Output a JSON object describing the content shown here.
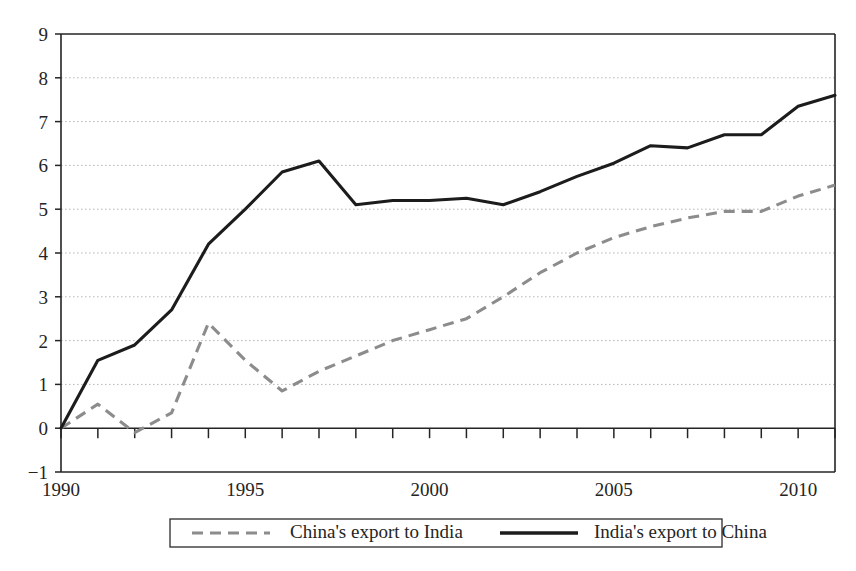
{
  "chart_data": {
    "type": "line",
    "title": "",
    "subtitle": "",
    "xlabel": "",
    "ylabel": "",
    "xlim": [
      1990,
      2011
    ],
    "ylim": [
      -1,
      9
    ],
    "grid": true,
    "legend_position": "bottom",
    "y_ticks": [
      -1,
      0,
      1,
      2,
      3,
      4,
      5,
      6,
      7,
      8,
      9
    ],
    "y_tick_labels": [
      "−1",
      "0",
      "1",
      "2",
      "3",
      "4",
      "5",
      "6",
      "7",
      "8",
      "9"
    ],
    "x_ticks": [
      1990,
      1991,
      1992,
      1993,
      1994,
      1995,
      1996,
      1997,
      1998,
      1999,
      2000,
      2001,
      2002,
      2003,
      2004,
      2005,
      2006,
      2007,
      2008,
      2009,
      2010,
      2011
    ],
    "x_tick_labels": [
      "1990",
      "",
      "",
      "",
      "",
      "1995",
      "",
      "",
      "",
      "",
      "2000",
      "",
      "",
      "",
      "",
      "2005",
      "",
      "",
      "",
      "",
      "2010",
      ""
    ],
    "x_labeled_years": [
      1990,
      1995,
      2000,
      2005,
      2010
    ],
    "x": [
      1990,
      1991,
      1992,
      1993,
      1994,
      1995,
      1996,
      1997,
      1998,
      1999,
      2000,
      2001,
      2002,
      2003,
      2004,
      2005,
      2006,
      2007,
      2008,
      2009,
      2010,
      2011
    ],
    "series": [
      {
        "name": "China's export to India",
        "style": "dashed",
        "color": "#8c8c8c",
        "values": [
          0.0,
          0.55,
          -0.1,
          0.35,
          2.4,
          1.55,
          0.85,
          1.3,
          1.65,
          2.0,
          2.25,
          2.5,
          3.0,
          3.55,
          4.0,
          4.35,
          4.6,
          4.8,
          4.95,
          4.95,
          5.3,
          5.55
        ]
      },
      {
        "name": "India's export to China",
        "style": "solid",
        "color": "#1c1c1c",
        "values": [
          0.0,
          1.55,
          1.9,
          2.7,
          4.2,
          5.0,
          5.85,
          6.1,
          5.1,
          5.2,
          5.2,
          5.25,
          5.1,
          5.4,
          5.75,
          6.05,
          6.45,
          6.4,
          6.7,
          6.7,
          7.35,
          7.6
        ]
      }
    ]
  },
  "legend": {
    "items": [
      {
        "label": "China's export to India",
        "style": "dashed",
        "color": "#8c8c8c"
      },
      {
        "label": "India's export to China",
        "style": "solid",
        "color": "#1c1c1c"
      }
    ]
  },
  "colors": {
    "background": "#ffffff",
    "axis": "#242424",
    "grid": "#b9b9b9",
    "solid_series": "#1c1c1c",
    "dashed_series": "#8c8c8c"
  }
}
